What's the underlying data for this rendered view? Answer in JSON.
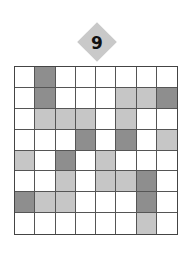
{
  "puzzle": {
    "number": "9",
    "rows": 8,
    "cols": 8,
    "colors": {
      "W": "#ffffff",
      "L": "#c6c6c6",
      "D": "#8e8e8e",
      "badge": "#c9c9c9"
    },
    "grid": [
      [
        "W",
        "D",
        "W",
        "W",
        "W",
        "W",
        "W",
        "W"
      ],
      [
        "W",
        "D",
        "W",
        "W",
        "W",
        "L",
        "L",
        "D"
      ],
      [
        "W",
        "L",
        "L",
        "L",
        "W",
        "L",
        "W",
        "W"
      ],
      [
        "W",
        "W",
        "W",
        "D",
        "W",
        "D",
        "W",
        "L"
      ],
      [
        "L",
        "W",
        "D",
        "W",
        "L",
        "W",
        "W",
        "W"
      ],
      [
        "W",
        "W",
        "L",
        "W",
        "L",
        "L",
        "D",
        "W"
      ],
      [
        "D",
        "L",
        "L",
        "W",
        "W",
        "W",
        "D",
        "W"
      ],
      [
        "W",
        "W",
        "W",
        "W",
        "W",
        "W",
        "L",
        "W"
      ]
    ]
  }
}
